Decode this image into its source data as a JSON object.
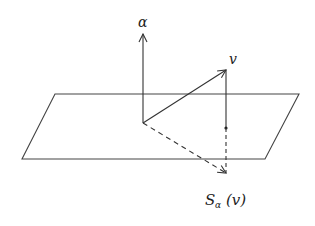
{
  "diagram": {
    "colors": {
      "line": "#333333",
      "background": "#ffffff"
    },
    "plane": {
      "points": [
        [
          55,
          94
        ],
        [
          299,
          94
        ],
        [
          265,
          159
        ],
        [
          22,
          159
        ]
      ]
    },
    "origin": [
      143,
      123
    ],
    "vectors": [
      {
        "name": "alpha",
        "label": "α",
        "from": [
          143,
          123
        ],
        "to": [
          143,
          34
        ],
        "style": "solid"
      },
      {
        "name": "v",
        "label": "v",
        "from": [
          143,
          123
        ],
        "to": [
          226,
          70
        ],
        "style": "solid"
      },
      {
        "name": "reflection",
        "label": "S",
        "subscript": "α",
        "argument": "(v)",
        "from": [
          143,
          123
        ],
        "to": [
          226,
          173
        ],
        "style": "dashed"
      }
    ],
    "projection_segment": {
      "from": [
        226,
        70
      ],
      "to": [
        226,
        128
      ],
      "style": "solid"
    },
    "projection_dashed": {
      "from": [
        226,
        128
      ],
      "to": [
        226,
        173
      ],
      "style": "dashed"
    },
    "plane_point": [
      226,
      128
    ],
    "labels": {
      "alpha": "α",
      "v": "v",
      "s_main": "S",
      "s_sub": "α",
      "s_arg": "(v)"
    }
  }
}
